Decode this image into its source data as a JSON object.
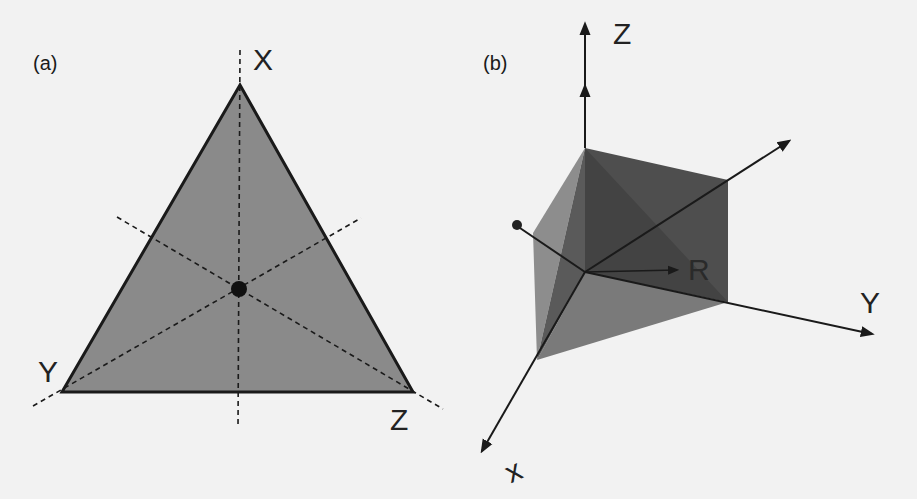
{
  "panel_a": {
    "label": "(a)",
    "vertices": {
      "X": "X",
      "Y": "Y",
      "Z": "Z"
    },
    "fill_color": "#8a8a8a",
    "edge_color": "#1a1a1a"
  },
  "panel_b": {
    "label": "(b)",
    "axes": {
      "Z": "Z",
      "Y": "Y",
      "X": "x"
    },
    "vector_label": "R",
    "fill_colors": {
      "dark": "#4a4a4a",
      "mid": "#6a6a6a",
      "light": "#8d8d8d"
    }
  }
}
